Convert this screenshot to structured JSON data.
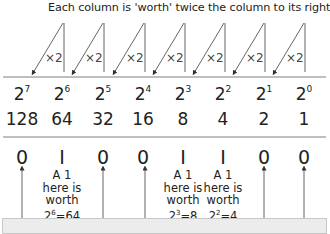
{
  "title": "Each column is 'worth' twice the column to its right",
  "multiplier_label": "×2",
  "columns": [
    {
      "base": "2",
      "exp": "7",
      "value": "128",
      "bit": "0"
    },
    {
      "base": "2",
      "exp": "6",
      "value": "64",
      "bit": "I"
    },
    {
      "base": "2",
      "exp": "5",
      "value": "32",
      "bit": "0"
    },
    {
      "base": "2",
      "exp": "4",
      "value": "16",
      "bit": "0"
    },
    {
      "base": "2",
      "exp": "3",
      "value": "8",
      "bit": "I"
    },
    {
      "base": "2",
      "exp": "2",
      "value": "4",
      "bit": "I"
    },
    {
      "base": "2",
      "exp": "1",
      "value": "2",
      "bit": "0"
    },
    {
      "base": "2",
      "exp": "0",
      "value": "1",
      "bit": "0"
    }
  ],
  "notes": [
    {
      "col": 1,
      "line1": "A 1",
      "line2": "here is",
      "line3": "worth",
      "base": "2",
      "exp": "6",
      "eq": "=64"
    },
    {
      "col": 4,
      "line1": "A 1",
      "line2": "here is",
      "line3": "worth",
      "base": "2",
      "exp": "3",
      "eq": "=8"
    },
    {
      "col": 5,
      "line1": "A 1",
      "line2": "here is",
      "line3": "worth",
      "base": "2",
      "exp": "2",
      "eq": "=4"
    }
  ],
  "colors": {
    "line": "#999999",
    "text": "#222222",
    "box": "#ececec"
  }
}
